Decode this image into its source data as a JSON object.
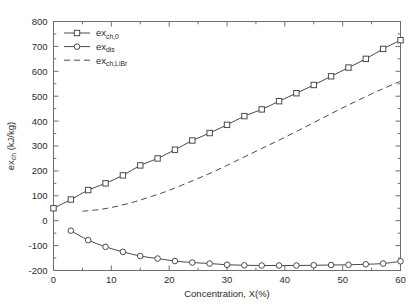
{
  "chart_data": {
    "type": "line",
    "title": "",
    "xlabel": "Concentration, X(%)",
    "ylabel": "ex_ch (kJ/kg)",
    "ylabel_base": "ex",
    "ylabel_sub": "ch",
    "ylabel_unit": " (kJ/kg)",
    "xlim": [
      0,
      60
    ],
    "ylim": [
      -200,
      800
    ],
    "xticks": [
      0,
      10,
      20,
      30,
      40,
      50,
      60
    ],
    "yticks": [
      -200,
      -100,
      0,
      100,
      200,
      300,
      400,
      500,
      600,
      700,
      800
    ],
    "xtick_labels": [
      "0",
      "10",
      "20",
      "30",
      "40",
      "50",
      "60"
    ],
    "ytick_labels": [
      "-200",
      "-100",
      "0",
      "100",
      "200",
      "300",
      "400",
      "500",
      "600",
      "700",
      "800"
    ],
    "xminor_step": 5,
    "yminor_step": 50,
    "grid": false,
    "legend_position": "upper-left-inside",
    "line_color": "#4a4a4a",
    "axis_color": "#6e6e6e",
    "background_color": "#ffffff",
    "series": [
      {
        "name": "ex_ch,0",
        "label_base": "ex",
        "label_sub": "ch,0",
        "marker": "square",
        "linestyle": "solid",
        "x": [
          0,
          3,
          6,
          9,
          12,
          15,
          18,
          21,
          24,
          27,
          30,
          33,
          36,
          39,
          42,
          45,
          48,
          51,
          54,
          57,
          60
        ],
        "values": [
          50,
          85,
          123,
          150,
          182,
          222,
          250,
          285,
          322,
          352,
          385,
          420,
          447,
          480,
          512,
          545,
          580,
          615,
          650,
          690,
          725
        ]
      },
      {
        "name": "ex_dis",
        "label_base": "ex",
        "label_sub": "dis",
        "marker": "circle",
        "linestyle": "solid",
        "x": [
          3,
          6,
          9,
          12,
          15,
          18,
          21,
          24,
          27,
          30,
          33,
          36,
          39,
          42,
          45,
          48,
          51,
          54,
          57,
          60
        ],
        "values": [
          -40,
          -78,
          -105,
          -125,
          -142,
          -152,
          -162,
          -168,
          -172,
          -177,
          -179,
          -180,
          -180,
          -180,
          -179,
          -178,
          -177,
          -175,
          -172,
          -163
        ]
      },
      {
        "name": "ex_ch,LiBr",
        "label_base": "ex",
        "label_sub": "ch,LiBr",
        "marker": "none",
        "linestyle": "dashed",
        "x": [
          5,
          8,
          11,
          14,
          17,
          20,
          24,
          28,
          32,
          36,
          40,
          44,
          48,
          52,
          56,
          60
        ],
        "values": [
          38,
          45,
          58,
          76,
          98,
          122,
          160,
          200,
          245,
          290,
          335,
          382,
          430,
          476,
          520,
          560
        ]
      }
    ]
  },
  "legend": {
    "items": [
      {
        "base": "ex",
        "sub": "ch,0"
      },
      {
        "base": "ex",
        "sub": "dis"
      },
      {
        "base": "ex",
        "sub": "ch,LiBr"
      }
    ]
  }
}
